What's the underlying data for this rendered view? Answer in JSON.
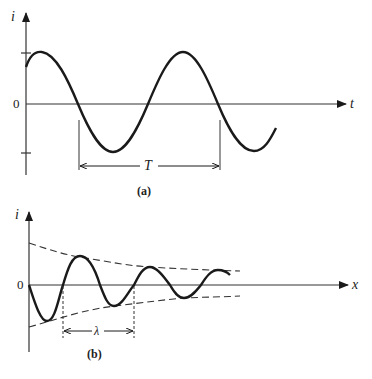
{
  "figure": {
    "panel_a": {
      "y_axis_label": "i",
      "x_axis_label": "t",
      "origin_label": "0",
      "period_label": "T",
      "caption": "(a)",
      "description": "Sinusoidal current i versus time t with period T"
    },
    "panel_b": {
      "y_axis_label": "i",
      "x_axis_label": "x",
      "origin_label": "0",
      "wavelength_label": "λ",
      "caption": "(b)",
      "description": "Damped sinusoidal current i versus distance x with decaying dashed envelope and wavelength λ"
    }
  },
  "colors": {
    "ink": "#1a1a1a",
    "axis": "#333333",
    "background": "#ffffff"
  }
}
